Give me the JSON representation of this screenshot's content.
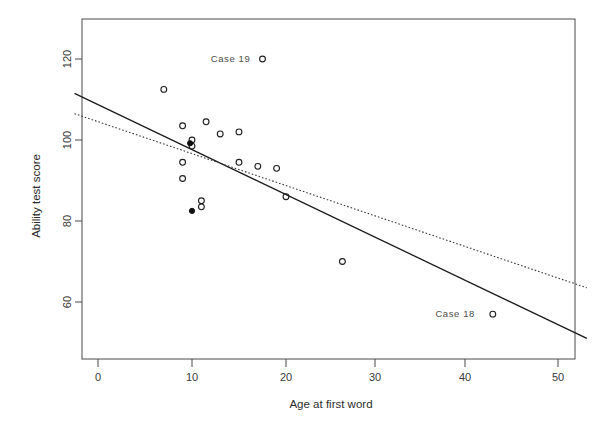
{
  "chart_data": {
    "type": "scatter",
    "title": "",
    "xlabel": "Age at first word",
    "ylabel": "Ability test score",
    "xlim": [
      -2.5,
      52
    ],
    "ylim": [
      49,
      127
    ],
    "xticks": [
      0,
      10,
      20,
      30,
      40,
      50
    ],
    "xtick_labels": [
      "0",
      "10",
      "20",
      "30",
      "40",
      "50"
    ],
    "yticks": [
      60,
      80,
      100,
      120
    ],
    "ytick_labels": [
      "60",
      "80",
      "100",
      "120"
    ],
    "grid": false,
    "legend": "none",
    "points": [
      {
        "x": 7.0,
        "y": 112.5,
        "marker": "open"
      },
      {
        "x": 9.0,
        "y": 103.5,
        "marker": "open"
      },
      {
        "x": 10.0,
        "y": 100.0,
        "marker": "open"
      },
      {
        "x": 10.0,
        "y": 98.5,
        "marker": "open"
      },
      {
        "x": 9.8,
        "y": 99.2,
        "marker": "filled"
      },
      {
        "x": 9.0,
        "y": 94.5,
        "marker": "open"
      },
      {
        "x": 9.0,
        "y": 90.5,
        "marker": "open"
      },
      {
        "x": 11.0,
        "y": 85.0,
        "marker": "open"
      },
      {
        "x": 11.0,
        "y": 83.5,
        "marker": "open"
      },
      {
        "x": 10.0,
        "y": 82.5,
        "marker": "filled"
      },
      {
        "x": 11.5,
        "y": 104.5,
        "marker": "open"
      },
      {
        "x": 13.0,
        "y": 101.5,
        "marker": "open"
      },
      {
        "x": 15.0,
        "y": 102.0,
        "marker": "open"
      },
      {
        "x": 15.0,
        "y": 94.5,
        "marker": "open"
      },
      {
        "x": 17.0,
        "y": 93.5,
        "marker": "open"
      },
      {
        "x": 19.0,
        "y": 93.0,
        "marker": "open"
      },
      {
        "x": 20.0,
        "y": 86.0,
        "marker": "open"
      },
      {
        "x": 17.5,
        "y": 120.0,
        "marker": "open"
      },
      {
        "x": 26.0,
        "y": 70.0,
        "marker": "open"
      },
      {
        "x": 42.0,
        "y": 57.0,
        "marker": "open"
      }
    ],
    "annotations": [
      {
        "text": "Case 19",
        "x": 14.1,
        "y": 120.0,
        "anchor_point_x": 17.5,
        "anchor_point_y": 120.0
      },
      {
        "text": "Case 18",
        "x": 38.0,
        "y": 57.0,
        "anchor_point_x": 42.0,
        "anchor_point_y": 57.0
      }
    ],
    "lines": [
      {
        "name": "ordinary-least-squares-fit",
        "style": "solid",
        "x": [
          -2.5,
          52.0
        ],
        "y": [
          111.5,
          51.0
        ]
      },
      {
        "name": "robust-fit",
        "style": "dotted",
        "x": [
          -2.5,
          52.0
        ],
        "y": [
          106.5,
          63.5
        ]
      }
    ]
  },
  "axes": {
    "x_title": "Age at first word",
    "y_title": "Ability test score"
  }
}
